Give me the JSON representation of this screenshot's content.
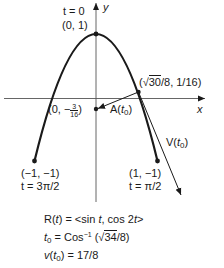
{
  "diagram": {
    "axes": {
      "x_label": "x",
      "y_label": "y"
    },
    "points": {
      "top": {
        "param": "t = 0",
        "coords": "(0, 1)"
      },
      "t0_point": {
        "coords_prefix": "(",
        "coords_sqrt": "30",
        "coords_suffix": "/8, 1/16)"
      },
      "accel_tip": {
        "prefix": "(0, −",
        "frac_num": "3",
        "frac_den": "16",
        "suffix": ")"
      },
      "left_end": {
        "coords": "(−1, −1)",
        "param": "t = 3π/2"
      },
      "right_end": {
        "coords": "(1, −1)",
        "param": "t = π/2"
      }
    },
    "vectors": {
      "acceleration": {
        "label_main": "A(",
        "label_t": "t",
        "label_sub": "0",
        "label_end": ")"
      },
      "velocity": {
        "label_main": "V(",
        "label_t": "t",
        "label_sub": "0",
        "label_end": ")"
      }
    },
    "equations": {
      "position": "R(t) = <sin t, cos 2t>",
      "position_parts": {
        "lhs": "R(",
        "t": "t",
        "mid": ") = <sin ",
        "t2": "t",
        "mid2": ", cos 2",
        "t3": "t",
        "end": ">"
      },
      "t0": {
        "lhs_t": "t",
        "lhs_sub": "0",
        "mid": " = Cos",
        "sup": "−1",
        "open": " (",
        "sqrt": "34",
        "close": "/8)"
      },
      "speed": {
        "lhs_v": "v",
        "open": "(",
        "t": "t",
        "sub": "0",
        "rhs": ") = 17/8"
      }
    },
    "colors": {
      "ink": "#1a1a1a",
      "background": "#ffffff"
    }
  }
}
